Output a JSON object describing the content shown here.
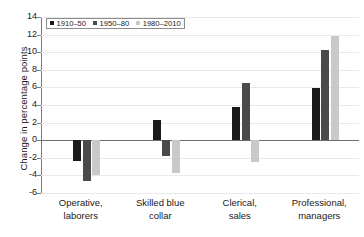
{
  "chart_data": {
    "type": "bar",
    "title": "",
    "subtitle": "",
    "xlabel": "",
    "ylabel": "Change in percentage points",
    "ylim": [
      -6,
      14
    ],
    "ytick_step": 2,
    "yticks": [
      14,
      12,
      10,
      8,
      6,
      4,
      2,
      0,
      -2,
      -4,
      -6
    ],
    "ytick_labels": [
      "14",
      "12",
      "10",
      "8",
      "6",
      "4",
      "2",
      "0",
      "-2",
      "-4",
      "-6"
    ],
    "grid": true,
    "legend_position": "top-left",
    "categories": [
      "Operative, laborers",
      "Skilled blue collar",
      "Clerical, sales",
      "Professional, managers"
    ],
    "category_lines": [
      [
        "Operative,",
        "laborers"
      ],
      [
        "Skilled blue",
        "collar"
      ],
      [
        "Clerical,",
        "sales"
      ],
      [
        "Professional,",
        "managers"
      ]
    ],
    "series": [
      {
        "name": "1910–50",
        "color": "#1a1a1a",
        "values": [
          -2.4,
          2.3,
          3.8,
          5.9
        ]
      },
      {
        "name": "1950–80",
        "color": "#4a4a4a",
        "values": [
          -4.6,
          -1.8,
          6.5,
          10.3
        ]
      },
      {
        "name": "1980–2010",
        "color": "#c9c9c9",
        "values": [
          -3.9,
          -3.7,
          -2.5,
          11.8
        ]
      }
    ]
  },
  "legend": {
    "items": [
      {
        "label": "1910–50"
      },
      {
        "label": "1950–80"
      },
      {
        "label": "1980–2010"
      }
    ]
  },
  "colors": {
    "series_1": "#1a1a1a",
    "series_2": "#4a4a4a",
    "series_3": "#c9c9c9",
    "axis": "#6e6e6e",
    "grid": "#e9e9e9",
    "background": "#ffffff"
  }
}
